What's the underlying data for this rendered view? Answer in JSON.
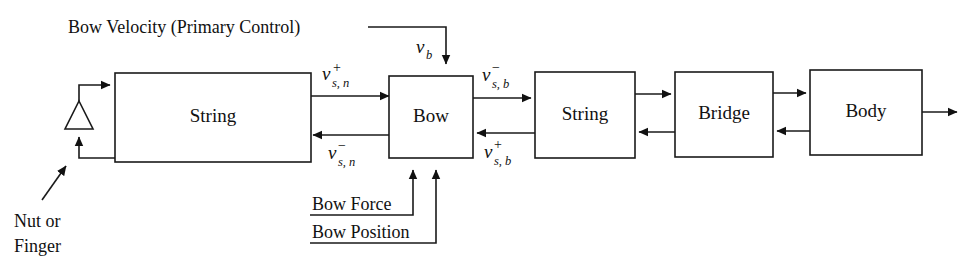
{
  "diagram": {
    "title_annotation": "Bow Velocity (Primary Control)",
    "blocks": [
      {
        "id": "string-left",
        "label": "String"
      },
      {
        "id": "bow",
        "label": "Bow"
      },
      {
        "id": "string-right",
        "label": "String"
      },
      {
        "id": "bridge",
        "label": "Bridge"
      },
      {
        "id": "body",
        "label": "Body"
      }
    ],
    "annotations": {
      "nut_or_finger_line1": "Nut or",
      "nut_or_finger_line2": "Finger",
      "bow_force": "Bow Force",
      "bow_position": "Bow Position"
    },
    "signals": [
      {
        "id": "v-b",
        "base": "v",
        "sup": "",
        "sub": "b",
        "description": "bow velocity input"
      },
      {
        "id": "v-s-n-plus",
        "base": "v",
        "sup": "+",
        "sub": "s, n",
        "description": "rightward wave at nut side"
      },
      {
        "id": "v-s-n-minus",
        "base": "v",
        "sup": "−",
        "sub": "s, n",
        "description": "leftward wave at nut side"
      },
      {
        "id": "v-s-b-minus",
        "base": "v",
        "sup": "−",
        "sub": "s, b",
        "description": "leftward wave at bow side"
      },
      {
        "id": "v-s-b-plus",
        "base": "v",
        "sup": "+",
        "sub": "s, b",
        "description": "rightward wave at bow side"
      }
    ],
    "colors": {
      "stroke": "#1a1a1a",
      "background": "#ffffff",
      "text": "#111111"
    }
  }
}
